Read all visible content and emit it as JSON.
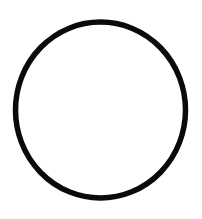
{
  "figure": {
    "shape": "circle-outline",
    "background": "#ffffff",
    "stroke_color": "#0a0a0a",
    "stroke_width": 5.5,
    "cx": 100.5,
    "cy": 110,
    "rx": 85,
    "ry": 88
  }
}
